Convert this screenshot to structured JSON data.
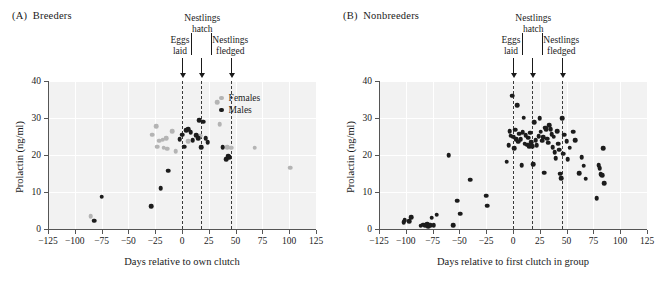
{
  "figure": {
    "panels": [
      {
        "key": "A",
        "tag": "(A)",
        "title": "Breeders",
        "xlabel": "Days relative to own clutch",
        "ylabel": "Prolactin (ng/ml)"
      },
      {
        "key": "B",
        "tag": "(B)",
        "title": "Nonbreeders",
        "xlabel": "Days relative to first clutch in group",
        "ylabel": "Prolactin (ng/ml)"
      }
    ],
    "events": [
      {
        "name": "eggs-laid",
        "label_line1": "Eggs",
        "label_line2": "laid",
        "day": 0
      },
      {
        "name": "nestlings-hatch",
        "label_line1": "Nestlings",
        "label_line2": "hatch",
        "day": 18
      },
      {
        "name": "nestlings-fledged",
        "label_line1": "Nestlings",
        "label_line2": "fledged",
        "day": 46
      }
    ],
    "legend": {
      "items": [
        {
          "label": "Females",
          "color": "#b4b4b4",
          "series": "females"
        },
        {
          "label": "Males",
          "color": "#1c1c1c",
          "series": "males"
        }
      ]
    },
    "colors": {
      "males": "#1c1c1c",
      "females": "#b4b4b4",
      "plot_background": "#f2f2f2",
      "gridline": "#ffffff",
      "reference_line": "#3b3b3b",
      "axis": "#555555"
    }
  },
  "chart_data": [
    {
      "type": "scatter",
      "panel": "A",
      "title": "(A) Breeders",
      "xlabel": "Days relative to own clutch",
      "ylabel": "Prolactin (ng/ml)",
      "xlim": [
        -125,
        125
      ],
      "ylim": [
        0,
        40
      ],
      "xticks": [
        -125,
        -100,
        -75,
        -50,
        -25,
        0,
        25,
        50,
        75,
        100,
        125
      ],
      "xticklabels": [
        "−125",
        "−100",
        "−75",
        "−50",
        "−25",
        "0",
        "25",
        "50",
        "75",
        "100",
        "125"
      ],
      "yticks": [
        0,
        10,
        20,
        30,
        40
      ],
      "yticklabels": [
        "0",
        "10",
        "20",
        "30",
        "40"
      ],
      "grid": true,
      "legend_position": "top-right",
      "reference_lines": [
        {
          "x": 0,
          "label": "Eggs laid"
        },
        {
          "x": 18,
          "label": "Nestlings hatch"
        },
        {
          "x": 46,
          "label": "Nestlings fledged"
        }
      ],
      "series": [
        {
          "name": "Females",
          "color": "#b4b4b4",
          "points": [
            [
              -85,
              3.4
            ],
            [
              -28,
              25.5
            ],
            [
              -24,
              27.8
            ],
            [
              -23,
              22.2
            ],
            [
              -21,
              23.9
            ],
            [
              -18,
              24.1
            ],
            [
              -17,
              22.0
            ],
            [
              -15,
              24.5
            ],
            [
              -14,
              21.7
            ],
            [
              -9,
              26.4
            ],
            [
              -6,
              21.1
            ],
            [
              6,
              23.8
            ],
            [
              17,
              25.2
            ],
            [
              33,
              34.2
            ],
            [
              35,
              28.4
            ],
            [
              42,
              22.1
            ],
            [
              46,
              22.0
            ],
            [
              68,
              22.0
            ],
            [
              101,
              16.6
            ]
          ]
        },
        {
          "name": "Males",
          "color": "#1c1c1c",
          "points": [
            [
              -82,
              2.2
            ],
            [
              -75,
              8.7
            ],
            [
              -29,
              6.2
            ],
            [
              -20,
              11.1
            ],
            [
              -13,
              15.8
            ],
            [
              -2,
              24.3
            ],
            [
              0,
              25.5
            ],
            [
              2,
              22.2
            ],
            [
              4,
              26.7
            ],
            [
              6,
              27.0
            ],
            [
              8,
              26.1
            ],
            [
              10,
              24.0
            ],
            [
              13,
              25.4
            ],
            [
              15,
              24.5
            ],
            [
              16,
              29.4
            ],
            [
              18,
              22.1
            ],
            [
              20,
              29.0
            ],
            [
              22,
              24.6
            ],
            [
              24,
              23.5
            ],
            [
              38,
              22.1
            ],
            [
              41,
              18.9
            ],
            [
              43,
              19.7
            ],
            [
              44,
              19.4
            ]
          ]
        }
      ]
    },
    {
      "type": "scatter",
      "panel": "B",
      "title": "(B) Nonbreeders",
      "xlabel": "Days relative to first clutch in group",
      "ylabel": "Prolactin (ng/ml)",
      "xlim": [
        -125,
        125
      ],
      "ylim": [
        0,
        40
      ],
      "xticks": [
        -125,
        -100,
        -75,
        -50,
        -25,
        0,
        25,
        50,
        75,
        100,
        125
      ],
      "xticklabels": [
        "−125",
        "−100",
        "−75",
        "−50",
        "−25",
        "0",
        "25",
        "50",
        "75",
        "100",
        "125"
      ],
      "yticks": [
        0,
        10,
        20,
        30,
        40
      ],
      "yticklabels": [
        "0",
        "10",
        "20",
        "30",
        "40"
      ],
      "grid": true,
      "legend_position": "none",
      "reference_lines": [
        {
          "x": 0,
          "label": "Eggs laid"
        },
        {
          "x": 18,
          "label": "Nestlings hatch"
        },
        {
          "x": 46,
          "label": "Nestlings fledged"
        }
      ],
      "series": [
        {
          "name": "Nonbreeders",
          "color": "#1c1c1c",
          "points": [
            [
              -102,
              1.8
            ],
            [
              -101,
              2.4
            ],
            [
              -97,
              2.1
            ],
            [
              -95,
              3.2
            ],
            [
              -86,
              0.9
            ],
            [
              -84,
              1.2
            ],
            [
              -82,
              1.0
            ],
            [
              -80,
              1.3
            ],
            [
              -79,
              0.8
            ],
            [
              -77,
              1.1
            ],
            [
              -76,
              3.1
            ],
            [
              -74,
              1.0
            ],
            [
              -71,
              3.9
            ],
            [
              -60,
              20.0
            ],
            [
              -56,
              1.1
            ],
            [
              -52,
              7.7
            ],
            [
              -49,
              4.1
            ],
            [
              -40,
              13.3
            ],
            [
              -25,
              9.0
            ],
            [
              -24,
              6.3
            ],
            [
              -6,
              18.2
            ],
            [
              -4,
              22.6
            ],
            [
              -3,
              26.4
            ],
            [
              -2,
              25.2
            ],
            [
              -1,
              36.0
            ],
            [
              0,
              24.9
            ],
            [
              1,
              21.8
            ],
            [
              2,
              26.8
            ],
            [
              3,
              24.2
            ],
            [
              4,
              33.4
            ],
            [
              5,
              23.6
            ],
            [
              6,
              25.8
            ],
            [
              7,
              24.3
            ],
            [
              8,
              17.2
            ],
            [
              9,
              26.2
            ],
            [
              10,
              30.1
            ],
            [
              11,
              23.1
            ],
            [
              12,
              25.4
            ],
            [
              13,
              22.8
            ],
            [
              14,
              24.7
            ],
            [
              15,
              22.4
            ],
            [
              16,
              26.0
            ],
            [
              17,
              23.4
            ],
            [
              18,
              22.3
            ],
            [
              19,
              17.5
            ],
            [
              20,
              28.8
            ],
            [
              21,
              24.0
            ],
            [
              22,
              22.6
            ],
            [
              24,
              25.1
            ],
            [
              25,
              30.0
            ],
            [
              26,
              26.3
            ],
            [
              27,
              23.9
            ],
            [
              28,
              24.8
            ],
            [
              29,
              15.2
            ],
            [
              30,
              27.4
            ],
            [
              31,
              26.9
            ],
            [
              32,
              24.4
            ],
            [
              33,
              23.3
            ],
            [
              34,
              28.1
            ],
            [
              35,
              27.0
            ],
            [
              36,
              25.6
            ],
            [
              37,
              22.1
            ],
            [
              38,
              24.9
            ],
            [
              39,
              20.7
            ],
            [
              40,
              19.2
            ],
            [
              41,
              26.5
            ],
            [
              42,
              23.0
            ],
            [
              43,
              21.4
            ],
            [
              44,
              15.0
            ],
            [
              45,
              13.8
            ],
            [
              46,
              30.0
            ],
            [
              47,
              20.3
            ],
            [
              48,
              25.5
            ],
            [
              50,
              23.8
            ],
            [
              51,
              18.9
            ],
            [
              53,
              22.0
            ],
            [
              56,
              26.3
            ],
            [
              58,
              24.0
            ],
            [
              62,
              15.1
            ],
            [
              64,
              19.4
            ],
            [
              66,
              17.1
            ],
            [
              68,
              13.6
            ],
            [
              78,
              8.3
            ],
            [
              80,
              17.3
            ],
            [
              81,
              16.5
            ],
            [
              82,
              14.8
            ],
            [
              83,
              14.6
            ],
            [
              84,
              21.8
            ],
            [
              85,
              12.4
            ]
          ]
        }
      ]
    }
  ]
}
